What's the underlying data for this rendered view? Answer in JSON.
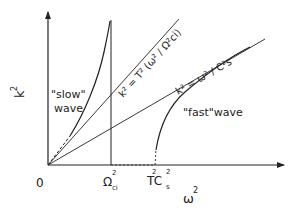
{
  "diagram": {
    "type": "dispersion-diagram",
    "axes": {
      "x_label": "ω",
      "x_label_sup": "2",
      "y_label": "k",
      "y_label_sup": "2",
      "origin_label": "0"
    },
    "ticks": {
      "omega_ci": {
        "main": "Ω",
        "sup": "2",
        "sub": "ci"
      },
      "t_cs": {
        "main": "TC",
        "pre_sup": "2",
        "sup": "2",
        "sub": "s"
      }
    },
    "lines": {
      "upper": {
        "label": "k² = T² (ω² / Ω²ci)"
      },
      "lower": {
        "label": "k² = ω² / C²s"
      }
    },
    "curves": {
      "slow": {
        "label_line1": "\"slow\"",
        "label_line2": "wave"
      },
      "fast": {
        "label": "\"fast\"wave"
      }
    },
    "colors": {
      "ink": "#222222",
      "background": "#ffffff"
    }
  }
}
